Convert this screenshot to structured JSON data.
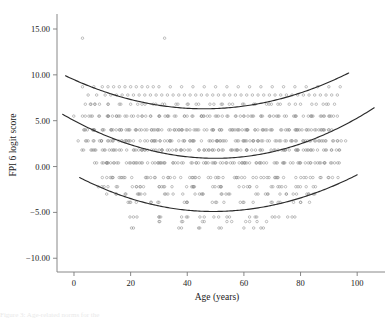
{
  "figure": {
    "caption_sliver": "Figure 3: Age-related norms for the",
    "marker_color": "#8d8d8d",
    "curve_color": "#2b2b2b",
    "axis_color": "#7a7a7a"
  },
  "chart_data": {
    "type": "scatter",
    "title": "",
    "xlabel": "Age (years)",
    "ylabel": "FPI 6 logit score",
    "xlim": [
      -6,
      107
    ],
    "ylim": [
      -11.5,
      16.2
    ],
    "grid": false,
    "legend": "none",
    "xticks": [
      0,
      20,
      40,
      60,
      80,
      100
    ],
    "xtick_labels": [
      "0",
      "20",
      "40",
      "60",
      "80",
      "100"
    ],
    "yticks": [
      15,
      10,
      5,
      0,
      -5,
      -10
    ],
    "ytick_labels": [
      "15.00",
      "10.00",
      "5.00",
      "0.00",
      "−5.00",
      "−10.00"
    ],
    "marker": "open-circle",
    "marker_size": 1.5,
    "series": [
      {
        "name": "observations",
        "note": "Individual FPI 6 logit scores by age; values quantized to discrete score bands",
        "x": [
          3,
          32,
          3,
          7,
          10,
          12,
          14,
          16,
          18,
          20,
          22,
          24,
          26,
          28,
          30,
          34,
          38,
          42,
          46,
          50,
          54,
          58,
          62,
          66,
          70,
          74,
          78,
          82,
          86,
          90,
          94,
          5,
          8,
          11,
          13,
          15,
          17,
          19,
          21,
          23,
          25,
          27,
          29,
          31,
          33,
          35,
          37,
          39,
          41,
          43,
          45,
          47,
          49,
          51,
          53,
          55,
          57,
          59,
          61,
          63,
          65,
          67,
          69,
          71,
          73,
          75,
          77,
          79,
          81,
          83,
          85,
          87,
          89,
          91,
          93,
          4,
          6,
          9,
          12,
          16,
          20,
          24,
          28,
          32,
          36,
          40,
          44,
          48,
          52,
          56,
          60,
          64,
          68,
          72,
          76,
          80,
          84,
          88,
          92,
          3,
          6,
          9,
          12,
          15,
          18,
          21,
          24,
          27,
          30,
          33,
          36,
          39,
          42,
          45,
          48,
          51,
          54,
          57,
          60,
          63,
          66,
          69,
          72,
          75,
          78,
          81,
          84,
          87,
          90,
          93,
          4,
          7,
          10,
          13,
          16,
          19,
          22,
          25,
          28,
          31,
          34,
          37,
          40,
          43,
          46,
          49,
          52,
          55,
          58,
          61,
          64,
          67,
          70,
          73,
          76,
          79,
          82,
          85,
          88,
          91,
          5,
          9,
          13,
          17,
          21,
          25,
          29,
          33,
          37,
          41,
          45,
          49,
          53,
          57,
          61,
          65,
          69,
          73,
          77,
          81,
          85,
          89,
          93,
          6,
          11,
          16,
          21,
          26,
          31,
          36,
          41,
          46,
          51,
          56,
          61,
          66,
          71,
          76,
          81,
          86,
          91,
          8,
          14,
          20,
          26,
          32,
          38,
          44,
          50,
          56,
          62,
          68,
          74,
          80,
          86,
          92,
          10,
          18,
          26,
          34,
          42,
          50,
          58,
          66,
          74,
          82,
          90,
          12,
          22,
          32,
          42,
          52,
          62,
          72,
          82,
          15,
          25,
          35,
          45,
          55,
          65,
          75,
          85,
          20,
          30,
          40,
          50,
          60,
          70,
          80,
          21,
          30,
          38,
          46,
          54,
          62,
          70,
          78,
          30,
          38,
          46,
          54,
          62,
          68,
          21,
          37,
          44,
          52,
          60,
          66
        ],
        "y": [
          14.0,
          14.0,
          8.7,
          8.7,
          8.7,
          8.7,
          8.7,
          8.7,
          8.7,
          8.7,
          8.7,
          8.7,
          8.7,
          8.7,
          8.7,
          8.7,
          8.7,
          8.7,
          8.7,
          8.7,
          8.7,
          8.7,
          8.7,
          8.7,
          8.7,
          8.7,
          8.7,
          8.7,
          8.7,
          8.7,
          8.7,
          7.8,
          7.8,
          7.8,
          7.8,
          7.8,
          7.8,
          7.8,
          7.8,
          7.8,
          7.8,
          7.8,
          7.8,
          7.8,
          7.8,
          7.8,
          7.8,
          7.8,
          7.8,
          7.8,
          7.8,
          7.8,
          7.8,
          7.8,
          7.8,
          7.8,
          7.8,
          7.8,
          7.8,
          7.8,
          7.8,
          7.8,
          7.8,
          7.8,
          7.8,
          7.8,
          7.8,
          7.8,
          7.8,
          7.8,
          7.8,
          7.8,
          7.8,
          7.8,
          7.8,
          6.8,
          6.8,
          6.8,
          6.8,
          6.8,
          6.8,
          6.8,
          6.8,
          6.8,
          6.8,
          6.8,
          6.8,
          6.8,
          6.8,
          6.8,
          6.8,
          6.8,
          6.8,
          6.8,
          6.8,
          6.8,
          6.8,
          6.8,
          6.8,
          5.5,
          5.5,
          5.5,
          5.5,
          5.5,
          5.5,
          5.5,
          5.5,
          5.5,
          5.5,
          5.5,
          5.5,
          5.5,
          5.5,
          5.5,
          5.5,
          5.5,
          5.5,
          5.5,
          5.5,
          5.5,
          5.5,
          5.5,
          5.5,
          5.5,
          5.5,
          5.5,
          5.5,
          5.5,
          5.5,
          5.5,
          4.0,
          4.0,
          4.0,
          4.0,
          4.0,
          4.0,
          4.0,
          4.0,
          4.0,
          4.0,
          4.0,
          4.0,
          4.0,
          4.0,
          4.0,
          4.0,
          4.0,
          4.0,
          4.0,
          4.0,
          4.0,
          4.0,
          4.0,
          4.0,
          4.0,
          4.0,
          4.0,
          4.0,
          4.0,
          4.0,
          2.8,
          2.8,
          2.8,
          2.8,
          2.8,
          2.8,
          2.8,
          2.8,
          2.8,
          2.8,
          2.8,
          2.8,
          2.8,
          2.8,
          2.8,
          2.8,
          2.8,
          2.8,
          2.8,
          2.8,
          2.8,
          2.8,
          2.8,
          1.8,
          1.8,
          1.8,
          1.8,
          1.8,
          1.8,
          1.8,
          1.8,
          1.8,
          1.8,
          1.8,
          1.8,
          1.8,
          1.8,
          1.8,
          1.8,
          1.8,
          1.8,
          0.4,
          0.4,
          0.4,
          0.4,
          0.4,
          0.4,
          0.4,
          0.4,
          0.4,
          0.4,
          0.4,
          0.4,
          0.4,
          0.4,
          0.4,
          -1.2,
          -1.2,
          -1.2,
          -1.2,
          -1.2,
          -1.2,
          -1.2,
          -1.2,
          -1.2,
          -1.2,
          -1.2,
          -2.2,
          -2.2,
          -2.2,
          -2.2,
          -2.2,
          -2.2,
          -2.2,
          -2.2,
          -3.0,
          -3.0,
          -3.0,
          -3.0,
          -3.0,
          -3.0,
          -3.0,
          -3.0,
          -3.9,
          -3.9,
          -3.9,
          -3.9,
          -3.9,
          -3.9,
          -3.9,
          -5.5,
          -5.5,
          -5.5,
          -5.5,
          -5.5,
          -5.5,
          -5.5,
          -5.5,
          -6.0,
          -6.0,
          -6.0,
          -6.0,
          -6.0,
          -6.0,
          -6.7,
          -6.7,
          -6.7,
          -6.7,
          -6.7,
          -6.7
        ]
      }
    ],
    "fitted_curves": [
      {
        "name": "upper-centile-curve",
        "shape": "quadratic",
        "description": "Upper reference centile: starts ~9.9 at age -3, minimum ~6.3 near age 46, rises to ~10.2 at age 97",
        "vertex": [
          46,
          6.3
        ],
        "x_start": -3,
        "y_start": 9.9,
        "x_end": 97,
        "y_end": 10.2
      },
      {
        "name": "median-curve",
        "shape": "quadratic",
        "description": "Median reference curve: starts ~5.7 at age -4, minimum ~0.9 near age 50, rises to ~6.4 at age 106",
        "vertex": [
          50,
          0.9
        ],
        "x_start": -4,
        "y_start": 5.7,
        "x_end": 106,
        "y_end": 6.4
      },
      {
        "name": "lower-centile-curve",
        "shape": "quadratic",
        "description": "Lower reference centile: starts ~-1.2 at age 2, minimum ~-4.9 near age 49, rises to ~-0.9 at age 100",
        "vertex": [
          49,
          -4.9
        ],
        "x_start": 2,
        "y_start": -1.2,
        "x_end": 100,
        "y_end": -0.9
      }
    ]
  }
}
